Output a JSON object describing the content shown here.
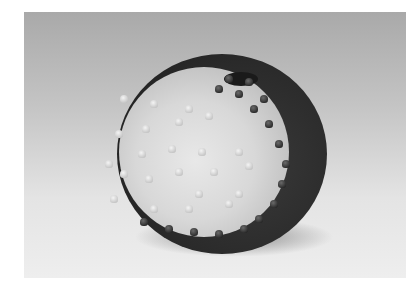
{
  "image": {
    "description": "Grayscale photograph of a round ceramic vessel covered in small conical spikes, half light and half dark in a yin-yang-like swirl, with a small opening on top, on a gradient studio backdrop",
    "colors": {
      "page_background": "#ffffff",
      "backdrop_top": "#a9a9a9",
      "backdrop_bottom": "#eeeeee",
      "light_glaze": "#d8d8d8",
      "dark_glaze": "#2a2a2a"
    }
  }
}
